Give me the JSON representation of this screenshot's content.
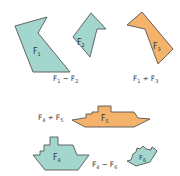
{
  "colors": {
    "teal": "#a3d6cd",
    "orange": "#f5b26b",
    "outline": "#555555",
    "text": "#333333"
  },
  "figures": [
    {
      "id": "F1",
      "base": "F",
      "sub": "1",
      "color": "teal",
      "shape": "irregular-pentagon"
    },
    {
      "id": "F2",
      "base": "F",
      "sub": "2",
      "color": "teal",
      "shape": "irregular-pentagon"
    },
    {
      "id": "F3",
      "base": "F",
      "sub": "3",
      "color": "orange",
      "shape": "irregular-pentagon"
    },
    {
      "id": "F4",
      "base": "F",
      "sub": "4",
      "color": "teal",
      "shape": "ship"
    },
    {
      "id": "F5",
      "base": "F",
      "sub": "5",
      "color": "orange",
      "shape": "ship-stretched"
    },
    {
      "id": "F6",
      "base": "F",
      "sub": "6",
      "color": "teal",
      "shape": "ship-rotated"
    }
  ],
  "relations": [
    {
      "left": "F",
      "left_sub": "1",
      "symbol": "~",
      "right": "F",
      "right_sub": "2",
      "meaning": "similar"
    },
    {
      "left": "F",
      "left_sub": "1",
      "symbol": "≁",
      "right": "F",
      "right_sub": "3",
      "meaning": "not similar"
    },
    {
      "left": "F",
      "left_sub": "4",
      "symbol": "≁",
      "right": "F",
      "right_sub": "5",
      "meaning": "not similar"
    },
    {
      "left": "F",
      "left_sub": "4",
      "symbol": "~",
      "right": "F",
      "right_sub": "6",
      "meaning": "similar"
    }
  ]
}
